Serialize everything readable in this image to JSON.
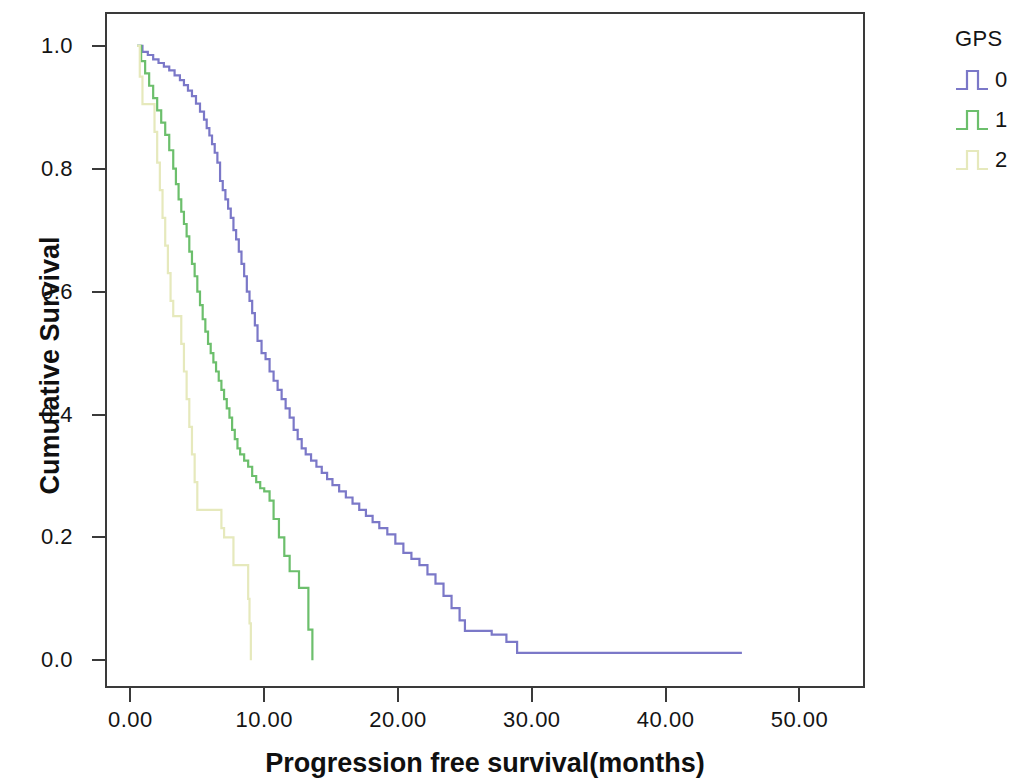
{
  "chart_data": {
    "type": "line",
    "subtype": "kaplan-meier-step",
    "title": "",
    "xlabel": "Progression free survival(months)",
    "ylabel": "Cumulative Survival",
    "xlim": [
      -1.9,
      54.9
    ],
    "ylim": [
      -0.045,
      1.055
    ],
    "xticks": [
      0,
      10,
      20,
      30,
      40,
      50
    ],
    "xtick_labels": [
      "0.00",
      "10.00",
      "20.00",
      "30.00",
      "40.00",
      "50.00"
    ],
    "yticks": [
      0.0,
      0.2,
      0.4,
      0.6,
      0.8,
      1.0
    ],
    "ytick_labels": [
      "0.0",
      "0.2",
      "0.4",
      "0.6",
      "0.8",
      "1.0"
    ],
    "grid": false,
    "legend": {
      "title": "GPS",
      "position": "right-top",
      "entries": [
        {
          "label": "0",
          "color": "#7b78c8"
        },
        {
          "label": "1",
          "color": "#6cbf6c"
        },
        {
          "label": "2",
          "color": "#e6e9bc"
        }
      ]
    },
    "series": [
      {
        "name": "0",
        "label": "GPS 0",
        "color": "#7b78c8",
        "points": [
          [
            0.5,
            1.0
          ],
          [
            0.9,
            0.99
          ],
          [
            1.3,
            0.985
          ],
          [
            1.7,
            0.978
          ],
          [
            2.1,
            0.972
          ],
          [
            2.5,
            0.966
          ],
          [
            2.9,
            0.96
          ],
          [
            3.3,
            0.952
          ],
          [
            3.7,
            0.944
          ],
          [
            4.0,
            0.936
          ],
          [
            4.3,
            0.927
          ],
          [
            4.6,
            0.918
          ],
          [
            4.9,
            0.906
          ],
          [
            5.2,
            0.893
          ],
          [
            5.5,
            0.88
          ],
          [
            5.7,
            0.866
          ],
          [
            5.9,
            0.854
          ],
          [
            6.1,
            0.84
          ],
          [
            6.3,
            0.826
          ],
          [
            6.5,
            0.81
          ],
          [
            6.7,
            0.78
          ],
          [
            6.9,
            0.765
          ],
          [
            7.1,
            0.75
          ],
          [
            7.3,
            0.735
          ],
          [
            7.5,
            0.72
          ],
          [
            7.7,
            0.7
          ],
          [
            7.9,
            0.685
          ],
          [
            8.1,
            0.665
          ],
          [
            8.3,
            0.645
          ],
          [
            8.5,
            0.625
          ],
          [
            8.7,
            0.6
          ],
          [
            8.9,
            0.585
          ],
          [
            9.1,
            0.565
          ],
          [
            9.3,
            0.545
          ],
          [
            9.5,
            0.52
          ],
          [
            9.8,
            0.5
          ],
          [
            10.1,
            0.49
          ],
          [
            10.4,
            0.47
          ],
          [
            10.7,
            0.455
          ],
          [
            11.0,
            0.44
          ],
          [
            11.3,
            0.425
          ],
          [
            11.6,
            0.41
          ],
          [
            11.9,
            0.395
          ],
          [
            12.2,
            0.375
          ],
          [
            12.5,
            0.36
          ],
          [
            12.8,
            0.345
          ],
          [
            13.1,
            0.335
          ],
          [
            13.5,
            0.325
          ],
          [
            13.9,
            0.315
          ],
          [
            14.3,
            0.305
          ],
          [
            14.7,
            0.295
          ],
          [
            15.1,
            0.285
          ],
          [
            15.6,
            0.275
          ],
          [
            16.1,
            0.265
          ],
          [
            16.6,
            0.255
          ],
          [
            17.1,
            0.245
          ],
          [
            17.6,
            0.235
          ],
          [
            18.1,
            0.225
          ],
          [
            18.6,
            0.215
          ],
          [
            19.2,
            0.205
          ],
          [
            19.8,
            0.19
          ],
          [
            20.4,
            0.175
          ],
          [
            21.0,
            0.165
          ],
          [
            21.6,
            0.155
          ],
          [
            22.2,
            0.14
          ],
          [
            22.8,
            0.125
          ],
          [
            23.4,
            0.105
          ],
          [
            24.0,
            0.085
          ],
          [
            24.6,
            0.065
          ],
          [
            25.0,
            0.048
          ],
          [
            26.8,
            0.048
          ],
          [
            27.0,
            0.042
          ],
          [
            27.8,
            0.042
          ],
          [
            28.1,
            0.03
          ],
          [
            28.6,
            0.03
          ],
          [
            28.9,
            0.012
          ],
          [
            45.7,
            0.012
          ]
        ]
      },
      {
        "name": "1",
        "label": "GPS 1",
        "color": "#6cbf6c",
        "points": [
          [
            0.5,
            1.0
          ],
          [
            0.8,
            0.975
          ],
          [
            1.1,
            0.955
          ],
          [
            1.4,
            0.935
          ],
          [
            1.7,
            0.915
          ],
          [
            2.0,
            0.895
          ],
          [
            2.3,
            0.875
          ],
          [
            2.6,
            0.855
          ],
          [
            2.9,
            0.83
          ],
          [
            3.2,
            0.8
          ],
          [
            3.4,
            0.775
          ],
          [
            3.6,
            0.75
          ],
          [
            3.8,
            0.73
          ],
          [
            4.0,
            0.71
          ],
          [
            4.2,
            0.69
          ],
          [
            4.4,
            0.665
          ],
          [
            4.6,
            0.645
          ],
          [
            4.8,
            0.625
          ],
          [
            5.0,
            0.6
          ],
          [
            5.2,
            0.578
          ],
          [
            5.4,
            0.555
          ],
          [
            5.6,
            0.535
          ],
          [
            5.8,
            0.515
          ],
          [
            6.0,
            0.5
          ],
          [
            6.2,
            0.485
          ],
          [
            6.4,
            0.47
          ],
          [
            6.6,
            0.455
          ],
          [
            6.8,
            0.44
          ],
          [
            7.0,
            0.425
          ],
          [
            7.2,
            0.41
          ],
          [
            7.4,
            0.395
          ],
          [
            7.6,
            0.375
          ],
          [
            7.8,
            0.36
          ],
          [
            8.0,
            0.345
          ],
          [
            8.2,
            0.335
          ],
          [
            8.5,
            0.325
          ],
          [
            8.8,
            0.315
          ],
          [
            9.1,
            0.3
          ],
          [
            9.4,
            0.29
          ],
          [
            9.7,
            0.28
          ],
          [
            10.0,
            0.275
          ],
          [
            10.4,
            0.26
          ],
          [
            10.7,
            0.23
          ],
          [
            11.1,
            0.2
          ],
          [
            11.5,
            0.17
          ],
          [
            11.9,
            0.145
          ],
          [
            12.4,
            0.145
          ],
          [
            12.6,
            0.118
          ],
          [
            13.1,
            0.118
          ],
          [
            13.3,
            0.05
          ],
          [
            13.6,
            0.05
          ],
          [
            13.6,
            0.0
          ]
        ]
      },
      {
        "name": "2",
        "label": "GPS 2",
        "color": "#e6e9bc",
        "points": [
          [
            0.5,
            1.0
          ],
          [
            0.7,
            0.95
          ],
          [
            0.9,
            0.905
          ],
          [
            1.6,
            0.905
          ],
          [
            1.8,
            0.86
          ],
          [
            2.0,
            0.81
          ],
          [
            2.2,
            0.765
          ],
          [
            2.4,
            0.72
          ],
          [
            2.6,
            0.675
          ],
          [
            2.8,
            0.63
          ],
          [
            3.0,
            0.585
          ],
          [
            3.2,
            0.56
          ],
          [
            3.6,
            0.56
          ],
          [
            3.8,
            0.515
          ],
          [
            4.0,
            0.47
          ],
          [
            4.2,
            0.425
          ],
          [
            4.4,
            0.38
          ],
          [
            4.6,
            0.335
          ],
          [
            4.8,
            0.29
          ],
          [
            5.0,
            0.245
          ],
          [
            6.6,
            0.245
          ],
          [
            6.8,
            0.215
          ],
          [
            7.0,
            0.2
          ],
          [
            7.5,
            0.2
          ],
          [
            7.7,
            0.155
          ],
          [
            8.6,
            0.155
          ],
          [
            8.8,
            0.1
          ],
          [
            8.9,
            0.06
          ],
          [
            9.0,
            0.02
          ],
          [
            9.0,
            0.0
          ]
        ]
      }
    ]
  },
  "axes": {
    "y_title": "Cumulative Survival",
    "x_title": "Progression free survival(months)"
  }
}
